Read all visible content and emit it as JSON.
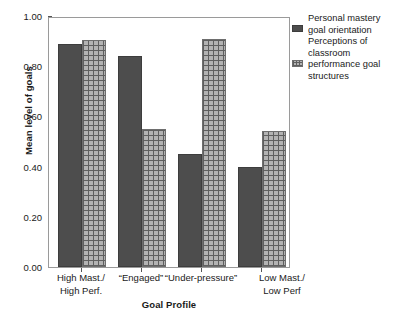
{
  "chart_data": {
    "type": "bar",
    "title": "",
    "xlabel": "Goal Profile",
    "ylabel": "Mean level of goals",
    "ylim": [
      0.0,
      1.0
    ],
    "ytick_labels": [
      "1.00",
      "0.80",
      "0.60",
      "0.40",
      "0.20",
      "0.00"
    ],
    "ytick_values": [
      1.0,
      0.8,
      0.6,
      0.4,
      0.2,
      0.0
    ],
    "grid": false,
    "legend_position": "right",
    "categories": [
      "High Mast./\nHigh Perf.",
      "“Engaged”",
      "“Under-pressure”",
      "Low Mast./\nLow Perf"
    ],
    "category_labels": [
      {
        "line1": "High Mast./",
        "line2": "High Perf."
      },
      {
        "line1": "“Engaged”",
        "line2": ""
      },
      {
        "line1": "“Under-pressure”",
        "line2": ""
      },
      {
        "line1": "Low Mast./",
        "line2": "Low Perf"
      }
    ],
    "series": [
      {
        "name": "Personal mastery goal orientation",
        "pattern": "solid",
        "color": "#4d4d4d",
        "values": [
          0.89,
          0.84,
          0.45,
          0.4
        ]
      },
      {
        "name": "Perceptions of classroom performance goal structures",
        "pattern": "crosshatch",
        "color": "#b3b3b3",
        "values": [
          0.905,
          0.55,
          0.91,
          0.54
        ]
      }
    ]
  },
  "legend": {
    "entries": [
      {
        "swatch": "solid",
        "lines": [
          "Personal mastery",
          "goal orientation"
        ]
      },
      {
        "swatch": "crosshatch",
        "lines": [
          "Perceptions of",
          "classroom",
          "performance goal",
          "structures"
        ]
      }
    ]
  }
}
